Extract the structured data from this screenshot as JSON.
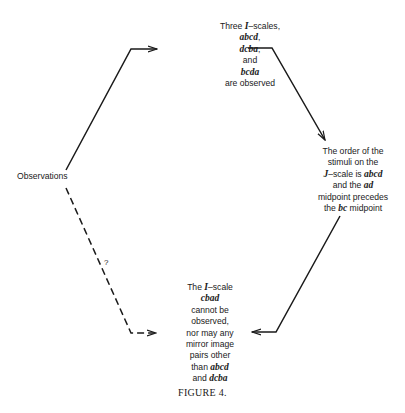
{
  "diagram": {
    "source_node": {
      "label": "Observations"
    },
    "top_node": {
      "lines": [
        {
          "parts": [
            {
              "t": "Three "
            },
            {
              "t": "I",
              "i": true
            },
            {
              "t": "–scales,"
            }
          ]
        },
        {
          "parts": [
            {
              "t": "abcd",
              "i": true
            },
            {
              "t": ","
            }
          ]
        },
        {
          "parts": [
            {
              "t": "dcba",
              "i": true
            },
            {
              "t": ","
            }
          ]
        },
        {
          "parts": [
            {
              "t": "and"
            }
          ]
        },
        {
          "parts": [
            {
              "t": "bcda",
              "i": true
            }
          ]
        },
        {
          "parts": [
            {
              "t": "are observed"
            }
          ]
        }
      ]
    },
    "right_node": {
      "lines": [
        {
          "parts": [
            {
              "t": "The order of the"
            }
          ]
        },
        {
          "parts": [
            {
              "t": "stimuli on the"
            }
          ]
        },
        {
          "parts": [
            {
              "t": "J",
              "i": true
            },
            {
              "t": "–scale is "
            },
            {
              "t": "abcd",
              "i": true
            }
          ]
        },
        {
          "parts": [
            {
              "t": "and the "
            },
            {
              "t": "ad",
              "i": true
            }
          ]
        },
        {
          "parts": [
            {
              "t": "midpoint precedes"
            }
          ]
        },
        {
          "parts": [
            {
              "t": "the "
            },
            {
              "t": "bc",
              "i": true
            },
            {
              "t": " midpoint"
            }
          ]
        }
      ]
    },
    "bottom_node": {
      "lines": [
        {
          "parts": [
            {
              "t": "The "
            },
            {
              "t": "I",
              "i": true
            },
            {
              "t": "–scale"
            }
          ]
        },
        {
          "parts": [
            {
              "t": "cbad",
              "i": true
            }
          ]
        },
        {
          "parts": [
            {
              "t": "cannot be"
            }
          ]
        },
        {
          "parts": [
            {
              "t": "observed,"
            }
          ]
        },
        {
          "parts": [
            {
              "t": "nor may any"
            }
          ]
        },
        {
          "parts": [
            {
              "t": "mirror image"
            }
          ]
        },
        {
          "parts": [
            {
              "t": "pairs other"
            }
          ]
        },
        {
          "parts": [
            {
              "t": "than "
            },
            {
              "t": "abcd",
              "i": true
            }
          ]
        },
        {
          "parts": [
            {
              "t": "and "
            },
            {
              "t": "dcba",
              "i": true
            }
          ]
        }
      ]
    },
    "dashed_edge_label": "?",
    "edges": [
      {
        "from": "Observations",
        "to": "top_node",
        "style": "solid"
      },
      {
        "from": "top_node",
        "to": "right_node",
        "style": "solid"
      },
      {
        "from": "right_node",
        "to": "bottom_node",
        "style": "solid"
      },
      {
        "from": "Observations",
        "to": "bottom_node",
        "style": "dashed",
        "label": "?"
      }
    ],
    "caption": "FIGURE 4."
  }
}
